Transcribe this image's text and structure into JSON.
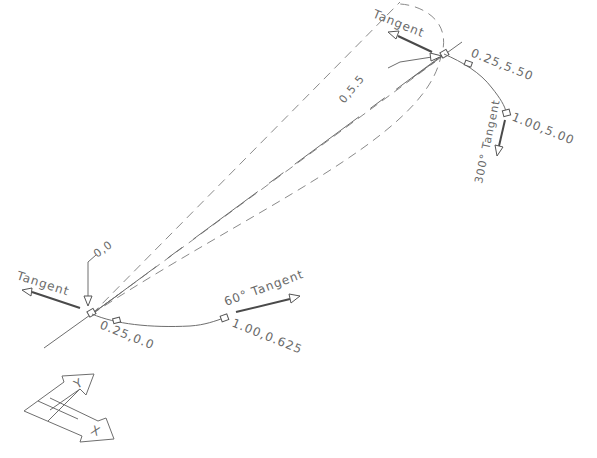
{
  "drawing": {
    "type": "spline-tangent-illustration",
    "colors": {
      "line": "#6e6e6e",
      "text": "#6a6a6a",
      "background": "#ffffff"
    },
    "start_point": {
      "label": "0,0",
      "tangent_label": "Tangent",
      "next_point_label": "0.25,0.0",
      "mid_point_label": "1.00,0.625",
      "mid_tangent_label": "60° Tangent"
    },
    "end_point": {
      "label": "0,5.5",
      "tangent_label": "Tangent",
      "next_point_label": "0.25,5.50",
      "far_point_label": "1.00,5.00",
      "far_tangent_label": "300° Tangent"
    },
    "ucs_icon": {
      "x_label": "X",
      "y_label": "Y"
    }
  }
}
